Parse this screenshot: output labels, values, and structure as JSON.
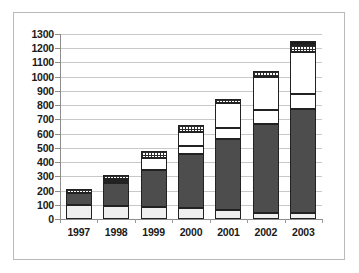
{
  "chart_data": {
    "type": "bar",
    "subtype": "stacked",
    "title": "",
    "xlabel": "",
    "ylabel": "",
    "categories": [
      "1997",
      "1998",
      "1999",
      "2000",
      "2001",
      "2002",
      "2003"
    ],
    "ytick_labels": [
      "1300",
      "1200",
      "1100",
      "1000",
      "900",
      "800",
      "700",
      "600",
      "500",
      "400",
      "300",
      "200",
      "100",
      "0"
    ],
    "ytick_values": [
      1300,
      1200,
      1100,
      1000,
      900,
      800,
      700,
      600,
      500,
      400,
      300,
      200,
      100,
      0
    ],
    "ylim": [
      0,
      1300
    ],
    "ytick_step": 100,
    "grid": true,
    "legend": "none",
    "series": [
      {
        "name": "segment-1-light-gray",
        "fill": "light-gray",
        "color": "#efefef",
        "values": [
          95,
          90,
          85,
          80,
          60,
          45,
          40
        ]
      },
      {
        "name": "segment-2-dark-gray",
        "fill": "dark-gray",
        "color": "#4d4d4d",
        "values": [
          85,
          160,
          260,
          380,
          505,
          625,
          735
        ]
      },
      {
        "name": "segment-3-white",
        "fill": "white",
        "color": "#ffffff",
        "values": [
          0,
          15,
          85,
          55,
          75,
          95,
          105
        ]
      },
      {
        "name": "segment-4-white-upper",
        "fill": "white",
        "color": "#ffffff",
        "values": [
          0,
          15,
          0,
          95,
          175,
          235,
          295
        ]
      },
      {
        "name": "segment-5-checkered",
        "fill": "checkered",
        "color": "#2b2b2b",
        "values": [
          30,
          30,
          45,
          50,
          25,
          40,
          50
        ]
      },
      {
        "name": "segment-6-black",
        "fill": "black",
        "color": "#1c1c1c",
        "values": [
          0,
          0,
          0,
          0,
          0,
          0,
          25
        ]
      }
    ],
    "totals": [
      210,
      310,
      475,
      660,
      840,
      1040,
      1250
    ]
  }
}
